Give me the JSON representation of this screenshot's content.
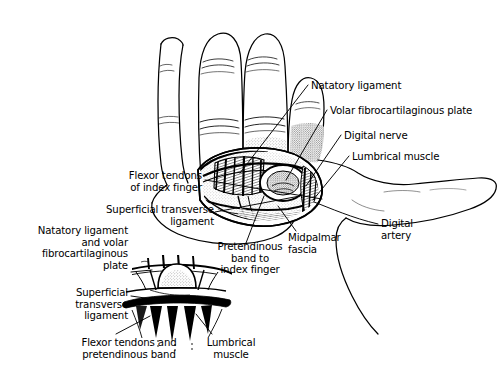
{
  "figure": {
    "kind": "anatomical-line-drawing",
    "background_color": "#ffffff",
    "ink_color": "#000000"
  },
  "labels": [
    {
      "id": "natatory-ligament",
      "text": "Natatory ligament",
      "align": "left",
      "x": 311,
      "y": 80,
      "width": 130
    },
    {
      "id": "volar-fibrocartilaginous-plate",
      "text": "Volar fibrocartilaginous plate",
      "align": "left",
      "x": 330,
      "y": 105,
      "width": 172
    },
    {
      "id": "digital-nerve",
      "text": "Digital nerve",
      "align": "left",
      "x": 344,
      "y": 130,
      "width": 100
    },
    {
      "id": "lumbrical-muscle-main",
      "text": "Lumbrical muscle",
      "align": "left",
      "x": 352,
      "y": 151,
      "width": 116
    },
    {
      "id": "flexor-tendons-index-finger",
      "text": "Flexor tendons\nof index finger",
      "align": "right",
      "x": 112,
      "y": 171,
      "width": 90
    },
    {
      "id": "superficial-transverse-ligament-main",
      "text": "Superficial transverse\nligament",
      "align": "right",
      "x": 92,
      "y": 205,
      "width": 120
    },
    {
      "id": "natatory-and-volar-plate",
      "text": "Natatory ligament\nand volar\nfibrocartilaginous\nplate",
      "align": "right",
      "x": 10,
      "y": 226,
      "width": 118
    },
    {
      "id": "superficial-transverse-ligament-inset",
      "text": "Superficial\ntransverse\nligament",
      "align": "right",
      "x": 28,
      "y": 288,
      "width": 100
    },
    {
      "id": "pretendinous-band-index-finger",
      "text": "Pretendinous\nband to\nindex finger",
      "align": "center",
      "x": 210,
      "y": 242,
      "width": 82
    },
    {
      "id": "midpalmar-fascia",
      "text": "Midpalmar\nfascia",
      "align": "left",
      "x": 288,
      "y": 232,
      "width": 62
    },
    {
      "id": "digital-artery",
      "text": "Digital\nartery",
      "align": "left",
      "x": 381,
      "y": 218,
      "width": 50
    },
    {
      "id": "flexor-tendons-pretendinous-band",
      "text": "Flexor tendons and\npretendinous band",
      "align": "center",
      "x": 68,
      "y": 338,
      "width": 122
    },
    {
      "id": "lumbrical-muscle-inset",
      "text": "Lumbrical\nmuscle",
      "align": "center",
      "x": 196,
      "y": 338,
      "width": 70
    }
  ],
  "structures": [
    "middle finger",
    "ring finger",
    "little finger",
    "index finger",
    "thumb",
    "palm",
    "dissection window",
    "inset cross-section"
  ]
}
